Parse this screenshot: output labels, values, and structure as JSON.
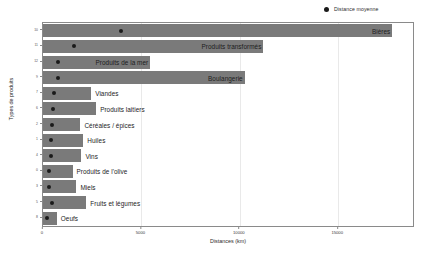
{
  "chart_data": {
    "type": "bar",
    "title": "",
    "xlabel": "Distances (km)",
    "ylabel": "Types de produits",
    "xlim": [
      0,
      18800
    ],
    "xticks": [
      0,
      5000,
      10000,
      15000
    ],
    "xticklabels": [
      "0",
      "5000",
      "10000",
      "15000"
    ],
    "grid": true,
    "legend": [
      {
        "label": "Distance moyenne",
        "marker": "dot",
        "color": "#1a1a1a"
      }
    ],
    "categories": [
      "Bières",
      "Produits transformés",
      "Produits de la mer",
      "Boulangerie",
      "Viandes",
      "Produits laitiers",
      "Céréales / épices",
      "Huiles",
      "Vins",
      "Produits de l'olive",
      "Miels",
      "Fruits et légumes",
      "Oeufs"
    ],
    "yticklabels": [
      "10",
      "11",
      "12",
      "9",
      "7",
      "6",
      "2",
      "1",
      "4",
      "0",
      "3",
      "5",
      "8"
    ],
    "series": [
      {
        "name": "Distance maximale",
        "type": "bar",
        "color": "#7a7a7a",
        "values": [
          17750,
          11200,
          5450,
          10250,
          2450,
          2700,
          1900,
          2050,
          1950,
          1500,
          1700,
          2200,
          700
        ]
      },
      {
        "name": "Distance moyenne",
        "type": "scatter",
        "color": "#1a1a1a",
        "values": [
          3950,
          1600,
          750,
          750,
          560,
          520,
          450,
          430,
          430,
          310,
          320,
          470,
          180
        ]
      }
    ],
    "bar_labels": [
      {
        "text": "Bières",
        "position": "inside-right"
      },
      {
        "text": "Produits transformés",
        "position": "inside-right"
      },
      {
        "text": "Produits de la mer",
        "position": "inside-right"
      },
      {
        "text": "Boulangerie",
        "position": "inside-right"
      },
      {
        "text": "Viandes",
        "position": "outside-right"
      },
      {
        "text": "Produits laitiers",
        "position": "outside-right"
      },
      {
        "text": "Céréales / épices",
        "position": "outside-right"
      },
      {
        "text": "Huiles",
        "position": "outside-right"
      },
      {
        "text": "Vins",
        "position": "outside-right"
      },
      {
        "text": "Produits de l'olive",
        "position": "outside-right"
      },
      {
        "text": "Miels",
        "position": "outside-right"
      },
      {
        "text": "Fruits et légumes",
        "position": "outside-right"
      },
      {
        "text": "Oeufs",
        "position": "outside-right"
      }
    ]
  },
  "colors": {
    "bar": "#7a7a7a",
    "dot": "#1a1a1a",
    "axis": "#8a8a8a",
    "grid": "#e9e9e9",
    "text": "#2b2b2b",
    "background": "#ffffff"
  }
}
